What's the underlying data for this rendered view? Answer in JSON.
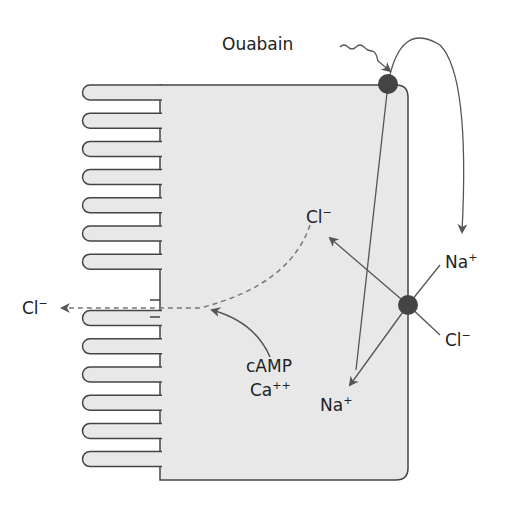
{
  "labels": {
    "ouabain": "Ouabain",
    "cl_in": "Cl",
    "cl_out_lumen": "Cl",
    "na_out": "Na",
    "cl_out_basal": "Cl",
    "na_in": "Na",
    "camp": "cAMP",
    "ca": "Ca",
    "minus": "−",
    "plus": "+",
    "plusplus": "++"
  },
  "colors": {
    "cell_fill": "#e8e8e8",
    "stroke": "#444",
    "pump": "#444"
  }
}
